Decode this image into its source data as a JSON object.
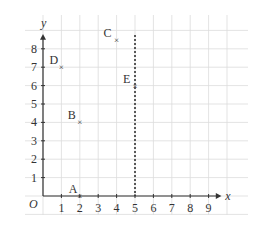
{
  "chart_data": {
    "type": "scatter",
    "title": "",
    "xlabel": "x",
    "ylabel": "y",
    "origin_label": "O",
    "xlim": [
      0,
      9
    ],
    "ylim": [
      0,
      8
    ],
    "x_ticks": [
      1,
      2,
      3,
      4,
      5,
      6,
      7,
      8,
      9
    ],
    "y_ticks": [
      1,
      2,
      3,
      4,
      5,
      6,
      7,
      8
    ],
    "grid": true,
    "points": [
      {
        "label": "A",
        "x": 2,
        "y": 0
      },
      {
        "label": "B",
        "x": 2,
        "y": 4
      },
      {
        "label": "C",
        "x": 4,
        "y": 8.5
      },
      {
        "label": "D",
        "x": 1,
        "y": 7
      },
      {
        "label": "E",
        "x": 5,
        "y": 6
      }
    ],
    "annotations": [
      {
        "type": "dashed-vertical-line",
        "x": 5,
        "description": "line x = 5"
      }
    ]
  },
  "colors": {
    "grid": "#dcdcdc",
    "axis": "#333333",
    "dashed_line": "#333333"
  }
}
